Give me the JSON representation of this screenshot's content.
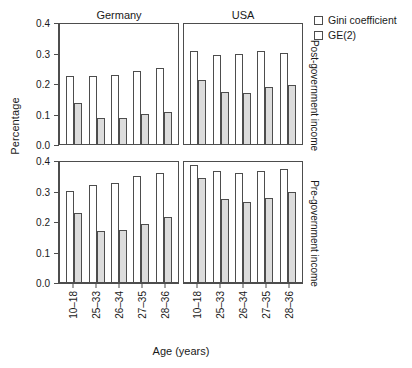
{
  "chart_data": {
    "type": "bar",
    "title": "",
    "xlabel": "Age (years)",
    "ylabel": "Percentage",
    "ylim": [
      0.0,
      0.4
    ],
    "yticks": [
      "0.0",
      "0.1",
      "0.2",
      "0.3",
      "0.4"
    ],
    "ytick_values": [
      0.0,
      0.1,
      0.2,
      0.3,
      0.4
    ],
    "grid": false,
    "legend_position": "top-right",
    "categories": [
      "10-18",
      "25-33",
      "26-34",
      "27-35",
      "28-36"
    ],
    "legend": [
      {
        "name": "Gini coefficient",
        "key": "gini",
        "fill": "#ffffff"
      },
      {
        "name": "GE(2)",
        "key": "ge2",
        "fill": "#dcdcdc"
      }
    ],
    "column_facets": [
      "Germany",
      "USA"
    ],
    "row_facets": [
      "Post-government income",
      "Pre-government income"
    ],
    "panels": [
      {
        "row": "Post-government income",
        "column": "Germany",
        "series": [
          {
            "name": "Gini coefficient",
            "values": [
              0.223,
              0.224,
              0.225,
              0.238,
              0.249
            ]
          },
          {
            "name": "GE(2)",
            "values": [
              0.136,
              0.084,
              0.084,
              0.098,
              0.104
            ]
          }
        ]
      },
      {
        "row": "Post-government income",
        "column": "USA",
        "series": [
          {
            "name": "Gini coefficient",
            "values": [
              0.304,
              0.291,
              0.294,
              0.305,
              0.3
            ]
          },
          {
            "name": "GE(2)",
            "values": [
              0.211,
              0.171,
              0.167,
              0.187,
              0.193
            ]
          }
        ]
      },
      {
        "row": "Pre-government income",
        "column": "Germany",
        "series": [
          {
            "name": "Gini coefficient",
            "values": [
              0.3,
              0.317,
              0.325,
              0.348,
              0.356
            ]
          },
          {
            "name": "GE(2)",
            "values": [
              0.226,
              0.166,
              0.169,
              0.191,
              0.213
            ]
          }
        ]
      },
      {
        "row": "Pre-government income",
        "column": "USA",
        "series": [
          {
            "name": "Gini coefficient",
            "values": [
              0.383,
              0.363,
              0.358,
              0.365,
              0.369
            ]
          },
          {
            "name": "GE(2)",
            "values": [
              0.342,
              0.272,
              0.262,
              0.275,
              0.294
            ]
          }
        ]
      }
    ]
  },
  "axes": {
    "ylabel": "Percentage",
    "xlabel": "Age (years)"
  },
  "legend": {
    "items": [
      {
        "label": "Gini coefficient"
      },
      {
        "label": "GE(2)"
      }
    ]
  },
  "facets": {
    "columns": [
      {
        "label": "Germany"
      },
      {
        "label": "USA"
      }
    ],
    "rows": [
      {
        "label": "Post-government income"
      },
      {
        "label": "Pre-government income"
      }
    ]
  }
}
